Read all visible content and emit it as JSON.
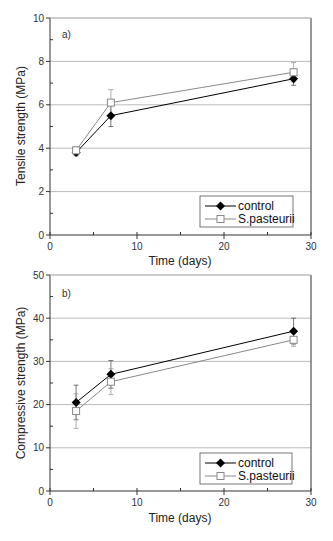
{
  "chart_data": [
    {
      "type": "line",
      "panel": "a)",
      "title": "",
      "xlabel": "Time (days)",
      "ylabel": "Tensile strength (MPa)",
      "xlim": [
        0,
        30
      ],
      "ylim": [
        0,
        10
      ],
      "xticks": [
        0,
        10,
        20,
        30
      ],
      "yticks": [
        0,
        2,
        4,
        6,
        8,
        10
      ],
      "grid": "horizontal",
      "legend_position": "lower right",
      "x": [
        3,
        7,
        28
      ],
      "series": [
        {
          "name": "control",
          "marker": "filled-diamond",
          "values": [
            3.8,
            5.5,
            7.2
          ],
          "errors": [
            0.15,
            0.5,
            0.3
          ]
        },
        {
          "name": "S.pasteurii",
          "marker": "open-square",
          "values": [
            3.9,
            6.1,
            7.5
          ],
          "errors": [
            0.15,
            0.6,
            0.45
          ]
        }
      ]
    },
    {
      "type": "line",
      "panel": "b)",
      "title": "",
      "xlabel": "Time (days)",
      "ylabel": "Compressive strength (MPa)",
      "xlim": [
        0,
        30
      ],
      "ylim": [
        0,
        50
      ],
      "xticks": [
        0,
        10,
        20,
        30
      ],
      "yticks": [
        0,
        10,
        20,
        30,
        40,
        50
      ],
      "grid": "horizontal",
      "legend_position": "lower right",
      "x": [
        3,
        7,
        28
      ],
      "series": [
        {
          "name": "control",
          "marker": "filled-diamond",
          "values": [
            20.5,
            27.0,
            37.0
          ],
          "errors": [
            4.0,
            3.2,
            3.0
          ]
        },
        {
          "name": "S.pasteurii",
          "marker": "open-square",
          "values": [
            18.5,
            25.3,
            35.0
          ],
          "errors": [
            4.0,
            3.0,
            1.5
          ]
        }
      ]
    }
  ],
  "labels": {
    "top": {
      "panel": "a)",
      "xlabel": "Time (days)",
      "ylabel": "Tensile strength (MPa)",
      "xticks": [
        "0",
        "10",
        "20",
        "30"
      ],
      "yticks": [
        "0",
        "2",
        "4",
        "6",
        "8",
        "10"
      ],
      "legend": [
        "control",
        "S.pasteurii"
      ]
    },
    "bottom": {
      "panel": "b)",
      "xlabel": "Time (days)",
      "ylabel": "Compressive strength (MPa)",
      "xticks": [
        "0",
        "10",
        "20",
        "30"
      ],
      "yticks": [
        "0",
        "10",
        "20",
        "30",
        "40",
        "50"
      ],
      "legend": [
        "control",
        "S.pasteurii"
      ]
    }
  },
  "colors": {
    "control": "#000000",
    "pasteurii_line": "#888888",
    "pasteurii_fill": "#ffffff",
    "grid": "#bbbbbb",
    "axis": "#333333"
  }
}
